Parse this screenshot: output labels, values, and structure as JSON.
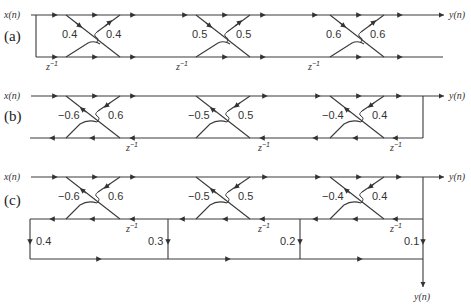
{
  "diagrams": [
    {
      "id": "a",
      "part_label": "(a)",
      "input_label": "x(n)",
      "output_label": "y(n)",
      "delay_label": "z",
      "delay_exp": "−1",
      "structure": "FIR lattice",
      "stages": [
        {
          "k_left": "0.4",
          "k_right": "0.4"
        },
        {
          "k_left": "0.5",
          "k_right": "0.5"
        },
        {
          "k_left": "0.6",
          "k_right": "0.6"
        }
      ]
    },
    {
      "id": "b",
      "part_label": "(b)",
      "input_label": "x(n)",
      "output_label": "y(n)",
      "delay_label": "z",
      "delay_exp": "−1",
      "structure": "IIR all-pole lattice",
      "stages": [
        {
          "k_left": "−0.6",
          "k_right": "0.6"
        },
        {
          "k_left": "−0.5",
          "k_right": "0.5"
        },
        {
          "k_left": "−0.4",
          "k_right": "0.4"
        }
      ]
    },
    {
      "id": "c",
      "part_label": "(c)",
      "input_label": "x(n)",
      "output_label_top": "y(n)",
      "output_label_bottom": "y(n)",
      "delay_label": "z",
      "delay_exp": "−1",
      "structure": "IIR lattice-ladder",
      "stages": [
        {
          "k_left": "−0.6",
          "k_right": "0.6"
        },
        {
          "k_left": "−0.5",
          "k_right": "0.5"
        },
        {
          "k_left": "−0.4",
          "k_right": "0.4"
        }
      ],
      "ladder_coefficients": [
        "0.4",
        "0.3",
        "0.2",
        "0.1"
      ]
    }
  ]
}
